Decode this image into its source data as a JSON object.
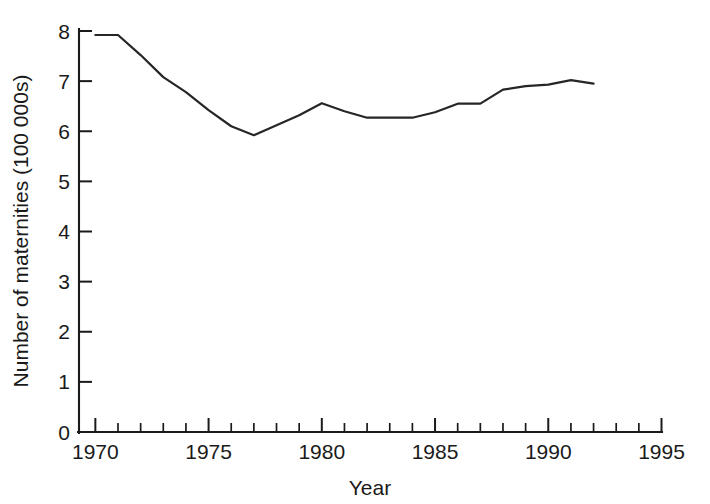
{
  "chart_data": {
    "type": "line",
    "title": "",
    "xlabel": "Year",
    "ylabel": "Number of maternities (100 000s)",
    "xlim": [
      1969.3,
      1995.0
    ],
    "ylim": [
      0,
      8
    ],
    "grid": false,
    "legend": null,
    "x_ticks_major": [
      1970,
      1975,
      1980,
      1985,
      1990,
      1995
    ],
    "x_tick_labels": [
      "1970",
      "1975",
      "1980",
      "1985",
      "1990",
      "1995"
    ],
    "x_minor_step": 1,
    "y_ticks": [
      0,
      1,
      2,
      3,
      4,
      5,
      6,
      7,
      8
    ],
    "y_tick_labels": [
      "0",
      "1",
      "2",
      "3",
      "4",
      "5",
      "6",
      "7",
      "8"
    ],
    "series": [
      {
        "name": "Number of maternities",
        "color": "#262626",
        "x": [
          1970,
          1971,
          1972,
          1973,
          1974,
          1975,
          1976,
          1977,
          1978,
          1979,
          1980,
          1981,
          1982,
          1983,
          1984,
          1985,
          1986,
          1987,
          1988,
          1989,
          1990,
          1991,
          1992
        ],
        "values": [
          7.92,
          7.92,
          7.52,
          7.08,
          6.78,
          6.42,
          6.1,
          5.92,
          6.12,
          6.32,
          6.56,
          6.4,
          6.27,
          6.27,
          6.27,
          6.38,
          6.55,
          6.55,
          6.83,
          6.9,
          6.93,
          7.02,
          6.95
        ]
      }
    ]
  }
}
